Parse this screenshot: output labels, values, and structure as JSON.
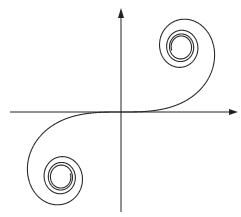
{
  "diagram": {
    "type": "euler-spiral",
    "colors": {
      "background": "#ffffff",
      "axis": "#222222",
      "curve": "#2a2a2a"
    },
    "axes": {
      "origin": [
        121,
        112
      ],
      "x_axis": {
        "from": 10,
        "to": 238,
        "arrow": "right"
      },
      "y_axis": {
        "from": 212,
        "to": 8,
        "arrow": "up"
      },
      "labels": []
    },
    "curve": {
      "equation": "x = C(t), y = S(t) (Fresnel integrals)",
      "t_range": [
        -3.9,
        3.9
      ],
      "scale_x": 120,
      "scale_y": 130,
      "limit_points": [
        [
          0.5,
          0.5
        ],
        [
          -0.5,
          -0.5
        ]
      ]
    }
  }
}
